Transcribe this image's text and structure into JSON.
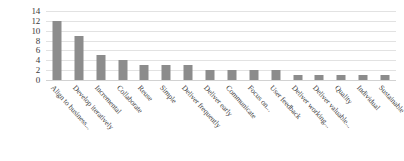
{
  "chart_data": {
    "type": "bar",
    "title": "",
    "subtitle": "",
    "xlabel": "",
    "ylabel": "",
    "ylim": [
      0,
      14
    ],
    "ytick_step": 2,
    "yticks": [
      14,
      12,
      10,
      8,
      6,
      4,
      2,
      0
    ],
    "grid": true,
    "legend": false,
    "legend_position": "none",
    "orientation": "vertical",
    "bar_color": "#8c8c8c",
    "gridline_color": "#e2e2e2",
    "categories": [
      "Align to business...",
      "Develop iteratively",
      "Incremental",
      "Collaborate",
      "Reuse",
      "Simple",
      "Deliver frequently",
      "Deliver early",
      "Communicate",
      "Focus on...",
      "User feedback",
      "Deliver working...",
      "Deliver valuable...",
      "Quality",
      "Individual",
      "Sustainable"
    ],
    "values": [
      12,
      9,
      5,
      4,
      3,
      3,
      3,
      2,
      2,
      2,
      2,
      1,
      1,
      1,
      1,
      1
    ]
  }
}
